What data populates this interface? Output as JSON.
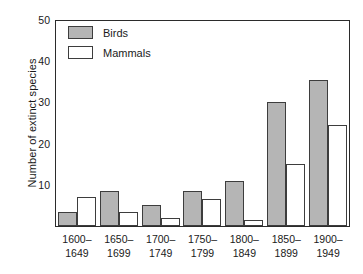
{
  "chart_data": {
    "type": "bar",
    "title": "",
    "xlabel": "",
    "ylabel": "Number of extinct species",
    "ylim": [
      0,
      50
    ],
    "yticks": [
      10,
      20,
      30,
      40,
      50
    ],
    "grid": false,
    "legend_position": "top-left",
    "categories": [
      "1600–1649",
      "1650–1699",
      "1700–1749",
      "1750–1799",
      "1800–1849",
      "1850–1899",
      "1900–1949"
    ],
    "category_lines": [
      [
        "1600–",
        "1649"
      ],
      [
        "1650–",
        "1699"
      ],
      [
        "1700–",
        "1749"
      ],
      [
        "1750–",
        "1799"
      ],
      [
        "1800–",
        "1849"
      ],
      [
        "1850–",
        "1899"
      ],
      [
        "1900–",
        "1949"
      ]
    ],
    "series": [
      {
        "name": "Birds",
        "color": "#b5b5b5",
        "values": [
          3.5,
          8.5,
          5,
          8.5,
          11,
          30,
          35.5
        ]
      },
      {
        "name": "Mammals",
        "color": "#ffffff",
        "values": [
          7,
          3.5,
          2,
          6.5,
          1.5,
          15,
          24.5
        ]
      }
    ]
  },
  "legend": {
    "items": [
      {
        "label": "Birds",
        "swatch": "birds"
      },
      {
        "label": "Mammals",
        "swatch": "mammals"
      }
    ]
  },
  "colors": {
    "bar_fill_birds": "#b5b5b5",
    "bar_fill_mammals": "#ffffff",
    "bar_border": "#3d3d3d",
    "axis": "#2b2b2b",
    "background": "#ffffff",
    "text": "#1a1a1a"
  }
}
